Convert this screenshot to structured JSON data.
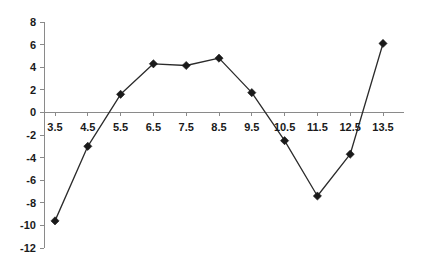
{
  "chart_data": {
    "type": "line",
    "title": "",
    "subtitle": "",
    "xlabel": "",
    "ylabel": "",
    "x": [
      3.5,
      4.5,
      5.5,
      6.5,
      7.5,
      8.5,
      9.5,
      10.5,
      11.5,
      12.5,
      13.5
    ],
    "values": [
      -9.6,
      -3.0,
      1.6,
      4.3,
      4.15,
      4.8,
      1.75,
      -2.5,
      -7.4,
      -3.7,
      6.1
    ],
    "series": [
      {
        "name": "",
        "values": [
          -9.6,
          -3.0,
          1.6,
          4.3,
          4.15,
          4.8,
          1.75,
          -2.5,
          -7.4,
          -3.7,
          6.1
        ]
      }
    ],
    "xlim": [
      3.0,
      14.0
    ],
    "ylim": [
      -12,
      8
    ],
    "x_tick_labels": [
      "3.5",
      "4.5",
      "5.5",
      "6.5",
      "7.5",
      "8.5",
      "9.5",
      "10.5",
      "11.5",
      "12.5",
      "13.5"
    ],
    "y_tick_labels": [
      "8",
      "6",
      "4",
      "2",
      "0",
      "-2",
      "-4",
      "-6",
      "-8",
      "-10",
      "-12"
    ],
    "y_ticks": [
      8,
      6,
      4,
      2,
      0,
      -2,
      -4,
      -6,
      -8,
      -10,
      -12
    ],
    "grid": false,
    "legend": null,
    "legend_position": "none",
    "marker": "diamond",
    "line_color": "#2b2b2b",
    "marker_color": "#1a1a1a",
    "axis_color": "#8a8a8a",
    "background_color": "#ffffff",
    "annotations": []
  }
}
